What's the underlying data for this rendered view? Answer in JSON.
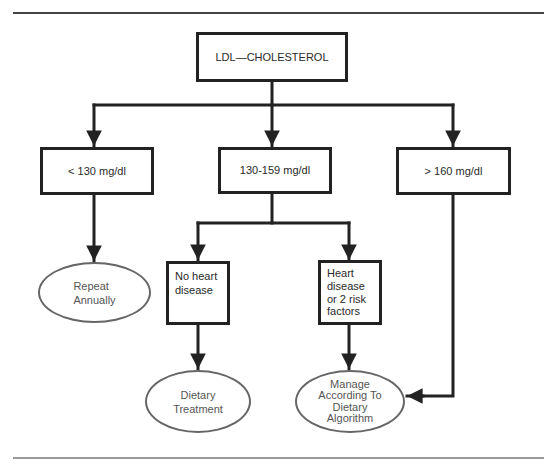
{
  "diagram": {
    "type": "flowchart",
    "colors": {
      "line": "#222222",
      "oval_border": "#666666",
      "oval_text": "#555555",
      "background": "#ffffff"
    },
    "root": {
      "id": "ldl",
      "label": "LDL—CHOLESTEROL"
    },
    "levels": [
      {
        "id": "lt130",
        "label": "< 130 mg/dl"
      },
      {
        "id": "mid",
        "label": "130-159 mg/dl"
      },
      {
        "id": "gt160",
        "label": "> 160 mg/dl"
      }
    ],
    "conditions": [
      {
        "id": "no_hd",
        "label": "No heart\ndisease"
      },
      {
        "id": "hd",
        "label": "Heart\ndisease\nor 2 risk\nfactors"
      }
    ],
    "outcomes": [
      {
        "id": "repeat",
        "label": "Repeat\nAnnually"
      },
      {
        "id": "dietary",
        "label": "Dietary\nTreatment"
      },
      {
        "id": "manage",
        "label": "Manage\nAccording To\nDietary\nAlgorithm"
      }
    ],
    "edges": [
      {
        "from": "ldl",
        "to": "lt130"
      },
      {
        "from": "ldl",
        "to": "mid"
      },
      {
        "from": "ldl",
        "to": "gt160"
      },
      {
        "from": "lt130",
        "to": "repeat"
      },
      {
        "from": "mid",
        "to": "no_hd"
      },
      {
        "from": "mid",
        "to": "hd"
      },
      {
        "from": "no_hd",
        "to": "dietary"
      },
      {
        "from": "hd",
        "to": "manage"
      },
      {
        "from": "gt160",
        "to": "manage"
      }
    ]
  }
}
